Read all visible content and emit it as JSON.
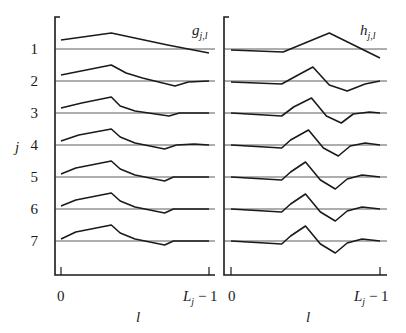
{
  "chart_data": [
    {
      "type": "line",
      "title": "g_{j,l}",
      "panel_label": "gj,l",
      "xlabel": "l",
      "ylabel": "j",
      "x_tick_labels": [
        "0",
        "Lj − 1"
      ],
      "row_labels": [
        "1",
        "2",
        "3",
        "4",
        "5",
        "6",
        "7"
      ],
      "grid": false,
      "x_range": [
        0,
        1
      ],
      "note": "Stacked profiles (j = 1..7) of wavelet scaling filter g_{j,l} versus l, each drawn over its own zero baseline; y values are offsets in px relative to baseline (negative = above).",
      "series": [
        {
          "name": "j=1",
          "points": [
            [
              0,
              -9
            ],
            [
              0.34,
              -16
            ],
            [
              0.72,
              -4
            ],
            [
              1,
              4
            ]
          ]
        },
        {
          "name": "j=2",
          "points": [
            [
              0,
              -6
            ],
            [
              0.34,
              -16
            ],
            [
              0.44,
              -8
            ],
            [
              0.55,
              -3
            ],
            [
              0.77,
              5
            ],
            [
              0.86,
              1
            ],
            [
              1,
              0
            ]
          ]
        },
        {
          "name": "j=3",
          "points": [
            [
              0,
              -5
            ],
            [
              0.14,
              -10
            ],
            [
              0.34,
              -16
            ],
            [
              0.4,
              -7
            ],
            [
              0.5,
              -2
            ],
            [
              0.73,
              3
            ],
            [
              0.8,
              0
            ],
            [
              1,
              0
            ]
          ]
        },
        {
          "name": "j=4",
          "points": [
            [
              0,
              -4
            ],
            [
              0.12,
              -10
            ],
            [
              0.34,
              -16
            ],
            [
              0.4,
              -8
            ],
            [
              0.5,
              -2
            ],
            [
              0.7,
              4
            ],
            [
              0.78,
              0
            ],
            [
              0.9,
              -1
            ],
            [
              1,
              0
            ]
          ]
        },
        {
          "name": "j=5",
          "points": [
            [
              0,
              -3
            ],
            [
              0.1,
              -9
            ],
            [
              0.34,
              -16
            ],
            [
              0.4,
              -8
            ],
            [
              0.5,
              -2
            ],
            [
              0.7,
              4
            ],
            [
              0.76,
              0
            ],
            [
              0.9,
              0
            ],
            [
              1,
              0
            ]
          ]
        },
        {
          "name": "j=6",
          "points": [
            [
              0,
              -3
            ],
            [
              0.1,
              -9
            ],
            [
              0.34,
              -16
            ],
            [
              0.4,
              -8
            ],
            [
              0.5,
              -2
            ],
            [
              0.7,
              4
            ],
            [
              0.76,
              0
            ],
            [
              0.9,
              0
            ],
            [
              1,
              0
            ]
          ]
        },
        {
          "name": "j=7",
          "points": [
            [
              0,
              -2
            ],
            [
              0.1,
              -9
            ],
            [
              0.34,
              -16
            ],
            [
              0.4,
              -8
            ],
            [
              0.5,
              -2
            ],
            [
              0.7,
              4
            ],
            [
              0.76,
              0
            ],
            [
              0.9,
              0
            ],
            [
              1,
              0
            ]
          ]
        }
      ]
    },
    {
      "type": "line",
      "title": "h_{j,l}",
      "panel_label": "hj,l",
      "xlabel": "l",
      "ylabel": "",
      "x_tick_labels": [
        "0",
        "Lj − 1"
      ],
      "grid": false,
      "x_range": [
        0,
        1
      ],
      "note": "Stacked profiles (j = 1..7) of wavelet filter h_{j,l} versus l; y values are px offsets relative to each row baseline.",
      "series": [
        {
          "name": "j=1",
          "points": [
            [
              0,
              1
            ],
            [
              0.35,
              3
            ],
            [
              0.66,
              -16
            ],
            [
              1,
              9
            ]
          ]
        },
        {
          "name": "j=2",
          "points": [
            [
              0,
              1
            ],
            [
              0.34,
              3
            ],
            [
              0.45,
              -6
            ],
            [
              0.55,
              -14
            ],
            [
              0.66,
              4
            ],
            [
              0.78,
              10
            ],
            [
              0.9,
              3
            ],
            [
              1,
              0
            ]
          ]
        },
        {
          "name": "j=3",
          "points": [
            [
              0,
              0
            ],
            [
              0.34,
              3
            ],
            [
              0.42,
              -6
            ],
            [
              0.54,
              -15
            ],
            [
              0.64,
              3
            ],
            [
              0.74,
              10
            ],
            [
              0.82,
              1
            ],
            [
              0.93,
              -1
            ],
            [
              1,
              0
            ]
          ]
        },
        {
          "name": "j=4",
          "points": [
            [
              0,
              0
            ],
            [
              0.34,
              3
            ],
            [
              0.4,
              -5
            ],
            [
              0.52,
              -15
            ],
            [
              0.62,
              3
            ],
            [
              0.72,
              11
            ],
            [
              0.8,
              1
            ],
            [
              0.9,
              -2
            ],
            [
              1,
              0
            ]
          ]
        },
        {
          "name": "j=5",
          "points": [
            [
              0,
              0
            ],
            [
              0.34,
              3
            ],
            [
              0.4,
              -5
            ],
            [
              0.5,
              -15
            ],
            [
              0.6,
              3
            ],
            [
              0.7,
              12
            ],
            [
              0.78,
              2
            ],
            [
              0.88,
              -2
            ],
            [
              1,
              0
            ]
          ]
        },
        {
          "name": "j=6",
          "points": [
            [
              0,
              0
            ],
            [
              0.34,
              3
            ],
            [
              0.4,
              -5
            ],
            [
              0.5,
              -15
            ],
            [
              0.6,
              3
            ],
            [
              0.7,
              12
            ],
            [
              0.78,
              2
            ],
            [
              0.88,
              -2
            ],
            [
              1,
              0
            ]
          ]
        },
        {
          "name": "j=7",
          "points": [
            [
              0,
              0
            ],
            [
              0.34,
              3
            ],
            [
              0.4,
              -5
            ],
            [
              0.5,
              -15
            ],
            [
              0.6,
              3
            ],
            [
              0.7,
              12
            ],
            [
              0.78,
              2
            ],
            [
              0.88,
              -2
            ],
            [
              1,
              0
            ]
          ]
        }
      ]
    }
  ],
  "labels": {
    "left_panel_title": "g",
    "left_panel_sub": "j,l",
    "right_panel_title": "h",
    "right_panel_sub": "j,l",
    "y_axis_label": "j",
    "left_x_tick_0": "0",
    "left_x_tick_end": "L",
    "left_x_tick_end_sub": "j",
    "left_x_tick_end_suffix": " − 1",
    "right_x_tick_0": "0",
    "right_x_tick_end": "L",
    "right_x_tick_end_sub": "j",
    "right_x_tick_end_suffix": " − 1",
    "left_x_axis_label": "l",
    "right_x_axis_label": "l",
    "rows": [
      "1",
      "2",
      "3",
      "4",
      "5",
      "6",
      "7"
    ]
  },
  "layout": {
    "line_color": "#1a1a1a",
    "baseline_color": "#333333",
    "row_baselines_px": [
      49,
      81,
      113,
      145,
      177,
      209,
      241
    ],
    "left_panel": {
      "axis_x": 55,
      "x0": 61,
      "x1": 209,
      "right_edge": 215,
      "top": 17,
      "bottom": 275
    },
    "right_panel": {
      "axis_x": 224,
      "x0": 231,
      "x1": 380,
      "right_edge": 387,
      "top": 17,
      "bottom": 275
    }
  }
}
